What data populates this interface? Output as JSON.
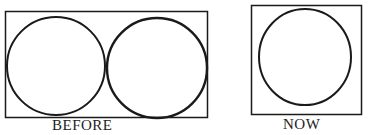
{
  "top_fragment": "",
  "panels": [
    {
      "label": "BEFORE",
      "circles": 2
    },
    {
      "label": "NOW",
      "circles": 1
    }
  ]
}
